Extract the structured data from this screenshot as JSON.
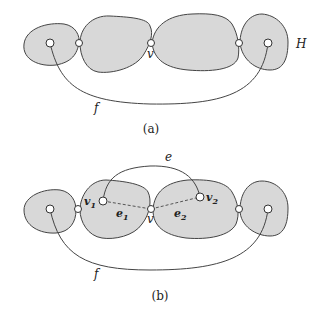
{
  "diagram": {
    "panel_a": {
      "caption": "(a)",
      "labels": {
        "cut_vertex": "v",
        "graph": "H",
        "edge": "f"
      }
    },
    "panel_b": {
      "caption": "(b)",
      "labels": {
        "cut_vertex": "v",
        "vertex1": "v",
        "vertex1_sub": "1",
        "vertex2": "v",
        "vertex2_sub": "2",
        "edge1": "e",
        "edge1_sub": "1",
        "edge2": "e",
        "edge2_sub": "2",
        "edge_e": "e",
        "edge_f": "f"
      }
    },
    "colors": {
      "block_fill": "#d8d8d8",
      "stroke": "#444444"
    }
  }
}
